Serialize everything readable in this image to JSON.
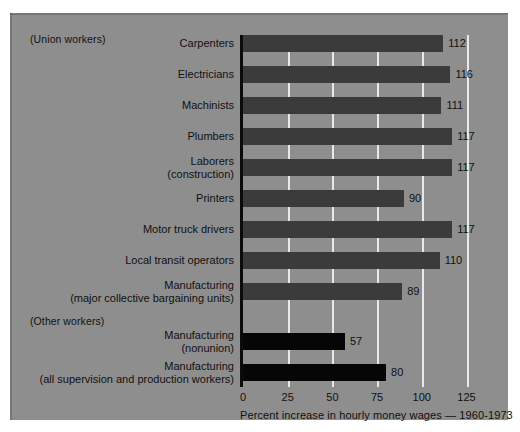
{
  "chart_data": {
    "type": "bar",
    "orientation": "horizontal",
    "title": "",
    "xlabel": "Percent increase in hourly money wages — 1960-1973",
    "ylabel": "",
    "xlim": [
      0,
      137
    ],
    "xticks": [
      0,
      25,
      50,
      75,
      100,
      125
    ],
    "xtick_labels": [
      "0",
      "25",
      "50",
      "75",
      "100",
      "125"
    ],
    "grid": "vertical-white-gridlines",
    "legend": "none",
    "group_labels": [
      "(Union workers)",
      "(Other workers)"
    ],
    "series": [
      {
        "name": "Union workers",
        "color": "#3b3b3b",
        "categories": [
          "Carpenters",
          "Electricians",
          "Machinists",
          "Plumbers",
          "Laborers\n(construction)",
          "Printers",
          "Motor truck drivers",
          "Local transit operators",
          "Manufacturing\n(major collective bargaining units)"
        ],
        "values": [
          112,
          116,
          111,
          117,
          117,
          90,
          117,
          110,
          89
        ]
      },
      {
        "name": "Other workers",
        "color": "#060606",
        "categories": [
          "Manufacturing\n(nonunion)",
          "Manufacturing\n(all supervision and production workers)"
        ],
        "values": [
          57,
          80
        ]
      }
    ]
  },
  "bars": [
    {
      "label_line1": "Carpenters",
      "label_line2": "",
      "value": 112,
      "value_text": "112",
      "group": "union"
    },
    {
      "label_line1": "Electricians",
      "label_line2": "",
      "value": 116,
      "value_text": "116",
      "group": "union"
    },
    {
      "label_line1": "Machinists",
      "label_line2": "",
      "value": 111,
      "value_text": "111",
      "group": "union"
    },
    {
      "label_line1": "Plumbers",
      "label_line2": "",
      "value": 117,
      "value_text": "117",
      "group": "union"
    },
    {
      "label_line1": "Laborers",
      "label_line2": "(construction)",
      "value": 117,
      "value_text": "117",
      "group": "union"
    },
    {
      "label_line1": "Printers",
      "label_line2": "",
      "value": 90,
      "value_text": "90",
      "group": "union"
    },
    {
      "label_line1": "Motor truck drivers",
      "label_line2": "",
      "value": 117,
      "value_text": "117",
      "group": "union"
    },
    {
      "label_line1": "Local transit operators",
      "label_line2": "",
      "value": 110,
      "value_text": "110",
      "group": "union"
    },
    {
      "label_line1": "Manufacturing",
      "label_line2": "(major collective bargaining units)",
      "value": 89,
      "value_text": "89",
      "group": "union"
    },
    {
      "label_line1": "Manufacturing",
      "label_line2": "(nonunion)",
      "value": 57,
      "value_text": "57",
      "group": "other"
    },
    {
      "label_line1": "Manufacturing",
      "label_line2": "(all supervision and production workers)",
      "value": 80,
      "value_text": "80",
      "group": "other"
    }
  ],
  "notes": {
    "union": "(Union workers)",
    "other": "(Other workers)"
  },
  "axis": {
    "title": "Percent increase in hourly money wages — 1960-1973",
    "ticks": [
      "0",
      "25",
      "50",
      "75",
      "100",
      "125"
    ]
  },
  "colors": {
    "background": "#8e8e8e",
    "union_bar": "#3b3b3b",
    "other_bar": "#060606",
    "gridline": "#e8e8e8",
    "axis": "#0b0b0b",
    "text": "#111111"
  }
}
